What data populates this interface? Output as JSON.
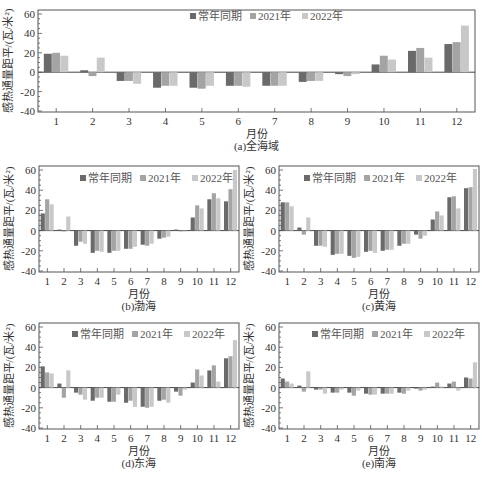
{
  "figure": {
    "caption": ""
  },
  "legend": {
    "items": [
      {
        "label": "常年同期",
        "color": "#6a6a6a"
      },
      {
        "label": "2021年",
        "color": "#a4a4a4"
      },
      {
        "label": "2022年",
        "color": "#c8c8c8"
      }
    ]
  },
  "axis": {
    "ylabel": "感热通量距平/(瓦/米²)",
    "xlabel": "月份",
    "yticks": [
      -40,
      -20,
      0,
      20,
      40,
      60
    ],
    "xticks": [
      "1",
      "2",
      "3",
      "4",
      "5",
      "6",
      "7",
      "8",
      "9",
      "10",
      "11",
      "12"
    ]
  },
  "chart_data": [
    {
      "type": "bar",
      "id": "a",
      "title": "(a)全海域",
      "xlabel": "月份",
      "ylabel": "感热通量距平/(瓦/米²)",
      "categories": [
        "1",
        "2",
        "3",
        "4",
        "5",
        "6",
        "7",
        "8",
        "9",
        "10",
        "11",
        "12"
      ],
      "ylim": [
        -40,
        60
      ],
      "legend_position": "top-center",
      "grid": false,
      "series": [
        {
          "name": "常年同期",
          "values": [
            19,
            2,
            -9,
            -16,
            -16,
            -14,
            -14,
            -10,
            -2,
            8,
            22,
            29
          ]
        },
        {
          "name": "2021年",
          "values": [
            20,
            -4,
            -9,
            -14,
            -17,
            -14,
            -14,
            -9,
            -4,
            17,
            25,
            31
          ]
        },
        {
          "name": "2022年",
          "values": [
            17,
            15,
            -12,
            -14,
            -14,
            -15,
            -14,
            -9,
            -2,
            13,
            15,
            48
          ]
        }
      ]
    },
    {
      "type": "bar",
      "id": "b",
      "title": "(b)渤海",
      "xlabel": "月份",
      "ylabel": "感热通量距平/(瓦/米²)",
      "categories": [
        "1",
        "2",
        "3",
        "4",
        "5",
        "6",
        "7",
        "8",
        "9",
        "10",
        "11",
        "12"
      ],
      "ylim": [
        -40,
        60
      ],
      "legend_position": "top-center",
      "grid": false,
      "series": [
        {
          "name": "常年同期",
          "values": [
            17,
            1,
            -15,
            -22,
            -22,
            -18,
            -14,
            -8,
            1,
            13,
            31,
            29
          ]
        },
        {
          "name": "2021年",
          "values": [
            31,
            0,
            -11,
            -20,
            -20,
            -18,
            -15,
            -7,
            0,
            25,
            37,
            41
          ]
        },
        {
          "name": "2022年",
          "values": [
            26,
            14,
            -13,
            -21,
            -20,
            -16,
            -13,
            -6,
            0,
            22,
            32,
            60
          ]
        }
      ]
    },
    {
      "type": "bar",
      "id": "c",
      "title": "(c)黄海",
      "xlabel": "月份",
      "ylabel": "感热通量距平/(瓦/米²)",
      "categories": [
        "1",
        "2",
        "3",
        "4",
        "5",
        "6",
        "7",
        "8",
        "9",
        "10",
        "11",
        "12"
      ],
      "ylim": [
        -40,
        60
      ],
      "legend_position": "top-center",
      "grid": false,
      "series": [
        {
          "name": "常年同期",
          "values": [
            28,
            3,
            -15,
            -24,
            -25,
            -21,
            -20,
            -15,
            -4,
            11,
            33,
            42
          ]
        },
        {
          "name": "2021年",
          "values": [
            28,
            -4,
            -15,
            -23,
            -27,
            -20,
            -19,
            -13,
            -8,
            19,
            34,
            43
          ]
        },
        {
          "name": "2022年",
          "values": [
            24,
            13,
            -16,
            -23,
            -26,
            -22,
            -19,
            -13,
            -5,
            15,
            22,
            61
          ]
        }
      ]
    },
    {
      "type": "bar",
      "id": "d",
      "title": "(d)东海",
      "xlabel": "月份",
      "ylabel": "感热通量距平/(瓦/米²)",
      "categories": [
        "1",
        "2",
        "3",
        "4",
        "5",
        "6",
        "7",
        "8",
        "9",
        "10",
        "11",
        "12"
      ],
      "ylim": [
        -40,
        60
      ],
      "legend_position": "top-center",
      "grid": false,
      "series": [
        {
          "name": "常年同期",
          "values": [
            21,
            4,
            -5,
            -13,
            -14,
            -15,
            -19,
            -13,
            -4,
            5,
            17,
            29
          ]
        },
        {
          "name": "2021年",
          "values": [
            15,
            -10,
            -7,
            -10,
            -14,
            -13,
            -20,
            -12,
            -8,
            18,
            22,
            31
          ]
        },
        {
          "name": "2022年",
          "values": [
            14,
            17,
            -12,
            -10,
            -7,
            -19,
            -19,
            -15,
            -2,
            12,
            6,
            47
          ]
        }
      ]
    },
    {
      "type": "bar",
      "id": "e",
      "title": "(e)南海",
      "xlabel": "月份",
      "ylabel": "感热通量距平/(瓦/米²)",
      "categories": [
        "1",
        "2",
        "3",
        "4",
        "5",
        "6",
        "7",
        "8",
        "9",
        "10",
        "11",
        "12"
      ],
      "ylim": [
        -40,
        60
      ],
      "legend_position": "top-center",
      "grid": false,
      "series": [
        {
          "name": "常年同期",
          "values": [
            9,
            2,
            -2,
            -5,
            -5,
            -6,
            -6,
            -5,
            -1,
            1,
            4,
            10
          ]
        },
        {
          "name": "2021年",
          "values": [
            6,
            -4,
            -2,
            -5,
            -8,
            -7,
            -6,
            -6,
            -3,
            5,
            6,
            9
          ]
        },
        {
          "name": "2022年",
          "values": [
            4,
            16,
            -6,
            -2,
            -3,
            -7,
            -6,
            -3,
            -2,
            1,
            -3,
            25
          ]
        }
      ]
    }
  ],
  "layout": {
    "panels": [
      {
        "id": "a",
        "x": 38,
        "y": 10,
        "w": 437,
        "h": 102,
        "legend_x": 190,
        "legend_y": 13
      },
      {
        "id": "b",
        "x": 39,
        "y": 166,
        "w": 200,
        "h": 106,
        "legend_x": 80,
        "legend_y": 175
      },
      {
        "id": "c",
        "x": 279,
        "y": 166,
        "w": 200,
        "h": 106,
        "legend_x": 304,
        "legend_y": 175
      },
      {
        "id": "d",
        "x": 39,
        "y": 323,
        "w": 200,
        "h": 106,
        "legend_x": 72,
        "legend_y": 331
      },
      {
        "id": "e",
        "x": 279,
        "y": 323,
        "w": 200,
        "h": 106,
        "legend_x": 312,
        "legend_y": 331
      }
    ]
  }
}
